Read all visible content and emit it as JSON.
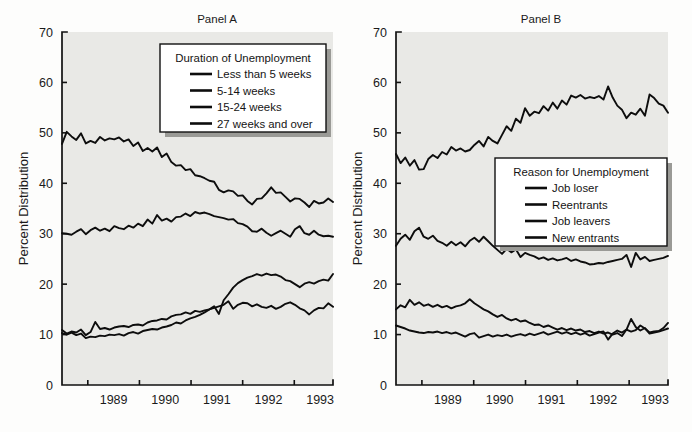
{
  "figure": {
    "background": "#fdfdfc",
    "plot_background": "#e9e9e6",
    "line_color": "#0d0d0d",
    "axis_color": "#111111"
  },
  "panelA": {
    "title": "Panel A",
    "ylabel": "Percent Distribution",
    "legend_title": "Duration of Unemployment"
  },
  "panelB": {
    "title": "Panel B",
    "ylabel": "Percent Distribution",
    "legend_title": "Reason for Unemployment"
  },
  "chart_data": [
    {
      "type": "line",
      "panel": "Panel A",
      "title": "Panel A",
      "xlabel": "",
      "ylabel": "Percent Distribution",
      "ylim": [
        0,
        70
      ],
      "yticks": [
        0,
        10,
        20,
        30,
        40,
        50,
        60,
        70
      ],
      "xlim": [
        1988.5,
        1993.75
      ],
      "xticks": [
        1989.0,
        1990.0,
        1991.0,
        1992.0,
        1993.0
      ],
      "xticklabels": [
        "1989",
        "1990",
        "1991",
        "1992",
        "1993"
      ],
      "xticklabel_placement": "centered-between-ticks",
      "grid": false,
      "legend_position": "upper-center",
      "legend_title": "Duration of Unemployment",
      "series": [
        {
          "name": "Less than 5 weeks",
          "values": [
            47.8,
            50.2,
            49.3,
            48.6,
            49.9,
            47.9,
            48.4,
            48.0,
            49.2,
            48.5,
            48.9,
            48.7,
            49.1,
            48.3,
            48.7,
            47.4,
            48.1,
            46.4,
            47.0,
            46.3,
            47.1,
            45.2,
            45.9,
            44.2,
            43.5,
            43.6,
            42.6,
            42.8,
            41.6,
            41.4,
            41.0,
            40.5,
            40.3,
            38.7,
            38.2,
            38.6,
            38.4,
            37.5,
            37.6,
            36.5,
            35.8,
            36.9,
            37.0,
            38.0,
            39.2,
            38.1,
            38.2,
            37.3,
            36.4,
            37.0,
            36.9,
            36.2,
            35.3,
            36.5,
            36.0,
            36.2,
            37.0,
            36.3
          ]
        },
        {
          "name": "5-14 weeks",
          "values": [
            30.1,
            30.0,
            29.8,
            30.4,
            30.9,
            29.9,
            30.7,
            31.2,
            30.6,
            31.0,
            30.5,
            31.5,
            31.1,
            30.9,
            31.6,
            31.2,
            32.0,
            31.5,
            32.8,
            32.0,
            33.7,
            32.6,
            33.0,
            32.4,
            33.3,
            33.4,
            34.0,
            33.5,
            34.3,
            34.0,
            34.2,
            33.9,
            33.5,
            33.3,
            33.1,
            32.8,
            32.9,
            32.1,
            31.9,
            31.4,
            30.5,
            30.4,
            31.0,
            30.2,
            29.6,
            30.1,
            30.6,
            30.0,
            29.4,
            30.9,
            31.5,
            30.1,
            29.8,
            30.6,
            29.8,
            29.5,
            29.6,
            29.4
          ]
        },
        {
          "name": "15-24 weeks",
          "values": [
            10.9,
            10.2,
            10.6,
            10.4,
            11.0,
            9.9,
            10.5,
            12.5,
            11.1,
            11.3,
            11.0,
            11.4,
            11.6,
            11.7,
            11.5,
            11.9,
            12.0,
            11.8,
            12.4,
            12.7,
            12.8,
            13.1,
            13.0,
            13.6,
            13.9,
            14.0,
            14.4,
            14.1,
            14.7,
            14.5,
            14.8,
            15.0,
            15.3,
            15.6,
            15.9,
            16.6,
            15.1,
            15.9,
            16.3,
            16.2,
            15.6,
            16.0,
            15.5,
            15.3,
            15.7,
            15.1,
            15.5,
            16.1,
            16.4,
            15.9,
            15.2,
            14.8,
            14.0,
            14.8,
            15.3,
            15.2,
            16.2,
            15.5
          ]
        },
        {
          "name": "27 weeks and over",
          "values": [
            10.3,
            10.0,
            10.4,
            9.9,
            10.2,
            9.3,
            9.6,
            9.5,
            9.8,
            9.7,
            10.0,
            9.9,
            10.1,
            9.8,
            10.3,
            10.5,
            10.2,
            10.7,
            10.9,
            11.1,
            11.0,
            11.4,
            11.6,
            11.9,
            12.4,
            12.2,
            12.8,
            13.2,
            13.5,
            13.9,
            14.4,
            15.0,
            15.6,
            14.1,
            16.8,
            18.0,
            19.3,
            20.2,
            20.8,
            21.3,
            21.6,
            22.0,
            21.7,
            22.1,
            21.8,
            21.9,
            21.5,
            20.8,
            20.6,
            20.0,
            19.4,
            20.1,
            20.4,
            20.1,
            20.6,
            20.9,
            20.7,
            22.0
          ]
        }
      ]
    },
    {
      "type": "line",
      "panel": "Panel B",
      "title": "Panel B",
      "xlabel": "",
      "ylabel": "Percent Distribution",
      "ylim": [
        0,
        70
      ],
      "yticks": [
        0,
        10,
        20,
        30,
        40,
        50,
        60,
        70
      ],
      "xlim": [
        1988.5,
        1993.75
      ],
      "xticks": [
        1989.0,
        1990.0,
        1991.0,
        1992.0,
        1993.0
      ],
      "xticklabels": [
        "1989",
        "1990",
        "1991",
        "1992",
        "1993"
      ],
      "xticklabel_placement": "centered-between-ticks",
      "grid": false,
      "legend_position": "center-right",
      "legend_title": "Reason for Unemployment",
      "series": [
        {
          "name": "Job loser",
          "values": [
            45.8,
            44.0,
            45.1,
            43.5,
            44.6,
            42.7,
            42.8,
            44.8,
            45.6,
            45.0,
            46.2,
            45.7,
            47.2,
            46.5,
            46.9,
            46.3,
            46.6,
            47.6,
            48.4,
            47.3,
            49.2,
            48.4,
            47.9,
            49.6,
            51.3,
            50.4,
            52.8,
            52.0,
            54.9,
            53.4,
            54.2,
            53.9,
            55.3,
            54.4,
            56.0,
            54.8,
            56.4,
            55.6,
            57.4,
            57.0,
            57.5,
            56.8,
            57.1,
            56.9,
            57.3,
            56.6,
            59.2,
            57.0,
            55.4,
            54.6,
            52.9,
            54.0,
            53.6,
            54.8,
            53.4,
            57.6,
            56.9,
            55.8,
            55.4,
            54.0
          ]
        },
        {
          "name": "Reentrants",
          "values": [
            27.6,
            29.0,
            29.8,
            28.8,
            30.5,
            31.2,
            29.4,
            29.0,
            29.6,
            28.6,
            28.2,
            27.6,
            28.4,
            27.7,
            28.3,
            27.5,
            28.6,
            29.2,
            28.4,
            29.4,
            28.5,
            27.6,
            26.8,
            26.0,
            27.0,
            26.3,
            26.9,
            25.4,
            26.2,
            25.8,
            25.5,
            25.0,
            25.3,
            24.8,
            25.1,
            24.7,
            24.9,
            25.2,
            24.6,
            24.9,
            24.5,
            24.3,
            23.9,
            24.0,
            24.2,
            24.1,
            24.4,
            24.6,
            24.8,
            25.0,
            25.8,
            23.4,
            26.2,
            24.9,
            25.4,
            24.6,
            24.8,
            25.0,
            25.2,
            25.6
          ]
        },
        {
          "name": "Job leavers",
          "values": [
            15.0,
            15.8,
            15.4,
            16.9,
            15.9,
            16.4,
            15.7,
            16.0,
            15.5,
            15.9,
            15.4,
            15.7,
            15.2,
            15.6,
            15.8,
            16.2,
            17.0,
            16.2,
            15.6,
            15.0,
            14.6,
            14.0,
            13.5,
            13.9,
            13.2,
            12.8,
            13.1,
            12.6,
            12.8,
            12.3,
            11.9,
            12.0,
            11.5,
            11.8,
            11.4,
            11.0,
            11.3,
            10.9,
            11.2,
            10.8,
            11.0,
            10.5,
            10.7,
            10.3,
            10.6,
            10.2,
            10.4,
            10.0,
            10.3,
            9.7,
            11.0,
            10.6,
            10.9,
            11.8,
            11.2,
            10.4,
            10.6,
            10.7,
            11.3,
            12.3
          ]
        },
        {
          "name": "New entrants",
          "values": [
            11.8,
            11.5,
            11.2,
            10.8,
            10.6,
            10.4,
            10.3,
            10.5,
            10.4,
            10.6,
            10.3,
            10.5,
            10.2,
            10.4,
            10.0,
            9.6,
            10.1,
            10.3,
            9.4,
            9.7,
            10.0,
            9.6,
            9.9,
            9.7,
            10.0,
            9.6,
            9.9,
            10.1,
            9.8,
            10.2,
            9.9,
            10.2,
            10.5,
            10.0,
            10.3,
            10.6,
            10.2,
            10.5,
            10.1,
            10.4,
            10.0,
            10.3,
            9.8,
            10.1,
            10.4,
            10.6,
            9.0,
            10.2,
            10.8,
            10.4,
            11.0,
            13.1,
            11.5,
            10.8,
            11.3,
            10.2,
            10.4,
            10.6,
            10.9,
            11.2
          ]
        }
      ]
    }
  ]
}
